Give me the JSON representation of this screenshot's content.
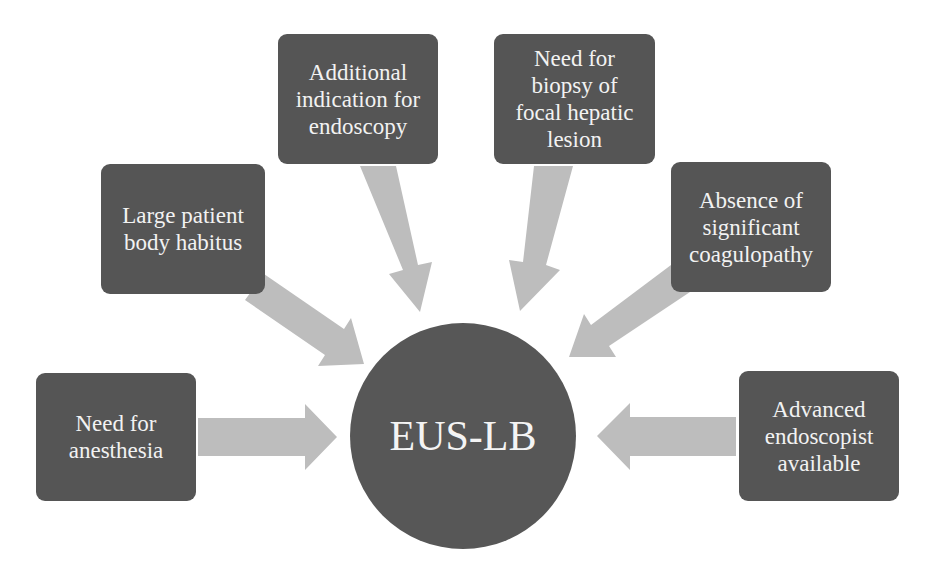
{
  "diagram": {
    "type": "hub-and-spoke",
    "colors": {
      "box": "#555555",
      "hub": "#575757",
      "arrow": "#bdbdbd",
      "text": "#f2f2f2",
      "background": "#ffffff"
    },
    "hub": {
      "label": "EUS-LB"
    },
    "factors": [
      {
        "id": "anesthesia",
        "lines": [
          "Need for",
          "anesthesia"
        ]
      },
      {
        "id": "body-habitus",
        "lines": [
          "Large patient",
          "body habitus"
        ]
      },
      {
        "id": "additional-indication",
        "lines": [
          "Additional",
          "indication for",
          "endoscopy"
        ]
      },
      {
        "id": "biopsy-focal-lesion",
        "lines": [
          "Need for",
          "biopsy of",
          "focal hepatic",
          "lesion"
        ]
      },
      {
        "id": "no-coagulopathy",
        "lines": [
          "Absence of",
          "significant",
          "coagulopathy"
        ]
      },
      {
        "id": "advanced-endoscopist",
        "lines": [
          "Advanced",
          "endoscopist",
          "available"
        ]
      }
    ],
    "edges": [
      {
        "from": "anesthesia",
        "to": "EUS-LB"
      },
      {
        "from": "body-habitus",
        "to": "EUS-LB"
      },
      {
        "from": "additional-indication",
        "to": "EUS-LB"
      },
      {
        "from": "biopsy-focal-lesion",
        "to": "EUS-LB"
      },
      {
        "from": "no-coagulopathy",
        "to": "EUS-LB"
      },
      {
        "from": "advanced-endoscopist",
        "to": "EUS-LB"
      }
    ]
  }
}
